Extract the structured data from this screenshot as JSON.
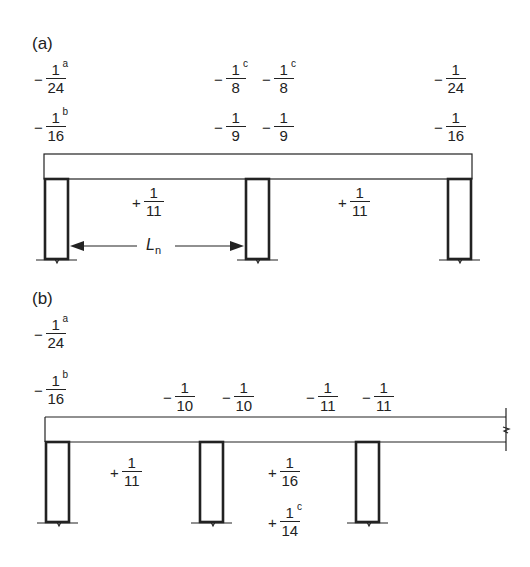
{
  "panels": [
    {
      "label": "(a)",
      "support_coefficients": [
        {
          "position": "exterior-left",
          "rows": [
            {
              "sign": "−",
              "num": "1",
              "sup": "a",
              "den": "24"
            },
            {
              "sign": "−",
              "num": "1",
              "sup": "b",
              "den": "16"
            }
          ]
        },
        {
          "position": "interior-left-face",
          "rows": [
            {
              "sign": "−",
              "num": "1",
              "sup": "c",
              "den": "8"
            },
            {
              "sign": "−",
              "num": "1",
              "sup": "",
              "den": "9"
            }
          ]
        },
        {
          "position": "interior-right-face",
          "rows": [
            {
              "sign": "−",
              "num": "1",
              "sup": "c",
              "den": "8"
            },
            {
              "sign": "−",
              "num": "1",
              "sup": "",
              "den": "9"
            }
          ]
        },
        {
          "position": "exterior-right",
          "rows": [
            {
              "sign": "−",
              "num": "1",
              "sup": "",
              "den": "24"
            },
            {
              "sign": "−",
              "num": "1",
              "sup": "",
              "den": "16"
            }
          ]
        }
      ],
      "span_coefficients": [
        {
          "sign": "+",
          "num": "1",
          "den": "11"
        },
        {
          "sign": "+",
          "num": "1",
          "den": "11"
        }
      ],
      "dimension": {
        "symbol": "L",
        "subscript": "n"
      }
    },
    {
      "label": "(b)",
      "support_coefficients": [
        {
          "position": "exterior-left",
          "rows": [
            {
              "sign": "−",
              "num": "1",
              "sup": "a",
              "den": "24"
            },
            {
              "sign": "−",
              "num": "1",
              "sup": "b",
              "den": "16"
            }
          ]
        },
        {
          "position": "first-interior-left",
          "rows": [
            {
              "sign": "−",
              "num": "1",
              "sup": "",
              "den": "10"
            }
          ]
        },
        {
          "position": "first-interior-right",
          "rows": [
            {
              "sign": "−",
              "num": "1",
              "sup": "",
              "den": "10"
            }
          ]
        },
        {
          "position": "second-interior-left",
          "rows": [
            {
              "sign": "−",
              "num": "1",
              "sup": "",
              "den": "11"
            }
          ]
        },
        {
          "position": "second-interior-right",
          "rows": [
            {
              "sign": "−",
              "num": "1",
              "sup": "",
              "den": "11"
            }
          ]
        }
      ],
      "span_coefficients": [
        {
          "sign": "+",
          "num": "1",
          "sup": "",
          "den": "11"
        },
        {
          "sign": "+",
          "num": "1",
          "sup": "",
          "den": "16"
        },
        {
          "sign": "+",
          "num": "1",
          "sup": "c",
          "den": "14"
        }
      ]
    }
  ],
  "colors": {
    "line": "#222222",
    "background": "#ffffff"
  }
}
